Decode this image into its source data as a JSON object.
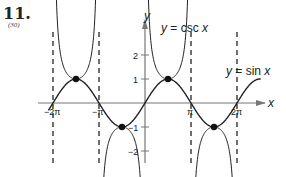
{
  "problem": {
    "number": "11.",
    "reference": "(30)"
  },
  "chart_data": {
    "type": "line",
    "title": "",
    "xlabel": "x",
    "ylabel": "y",
    "x_ticks": [
      {
        "label": "−2π",
        "value": -6.2832
      },
      {
        "label": "−π",
        "value": -3.1416
      },
      {
        "label": "π",
        "value": 3.1416
      },
      {
        "label": "2π",
        "value": 6.2832
      }
    ],
    "y_ticks": [
      {
        "label": "2",
        "value": 2
      },
      {
        "label": "1",
        "value": 1
      },
      {
        "label": "−1",
        "value": -1
      },
      {
        "label": "−2",
        "value": -2
      }
    ],
    "xlim": [
      -7.2,
      8.5
    ],
    "ylim": [
      -2.5,
      3.3
    ],
    "grid": false,
    "asymptotes": [
      -6.2832,
      -3.1416,
      3.1416,
      6.2832
    ],
    "intersection_points": [
      {
        "x": -4.7124,
        "y": 1
      },
      {
        "x": -1.5708,
        "y": -1
      },
      {
        "x": 1.5708,
        "y": 1
      },
      {
        "x": 4.7124,
        "y": -1
      }
    ],
    "series": [
      {
        "name": "y = sin x",
        "function": "sin",
        "x_range": [
          -6.6,
          7.9
        ]
      },
      {
        "name": "y = csc x",
        "function": "csc",
        "branches": [
          {
            "x_range": [
              -6.15,
              -3.27
            ],
            "direction": "up"
          },
          {
            "x_range": [
              -3.01,
              -0.13
            ],
            "direction": "down"
          },
          {
            "x_range": [
              0.13,
              3.01
            ],
            "direction": "up"
          },
          {
            "x_range": [
              3.27,
              6.15
            ],
            "direction": "down"
          }
        ]
      }
    ],
    "annotations": [
      {
        "text": "y = csc x",
        "position": "upper-middle"
      },
      {
        "text": "y = sin x",
        "position": "right"
      }
    ]
  },
  "labels": {
    "x_axis": "x",
    "y_axis": "y",
    "csc_label_var": "y",
    "csc_label_rest": " = csc ",
    "csc_label_x": "x",
    "sin_label_var": "y",
    "sin_label_rest": " = sin ",
    "sin_label_x": "x",
    "tick_neg2pi": "−2π",
    "tick_negpi": "−π",
    "tick_pi": "π",
    "tick_2pi": "2π",
    "tick_y2": "2",
    "tick_y1": "1",
    "tick_yneg1": "−1",
    "tick_yneg2": "−2"
  }
}
